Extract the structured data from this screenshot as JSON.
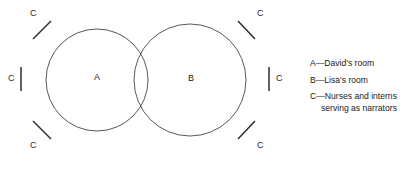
{
  "diagram": {
    "type": "venn-two-set",
    "title": "",
    "background_color": "#ffffff",
    "stroke_color": "#2b2b2b",
    "sets": [
      {
        "id": "A",
        "label": "A",
        "meaning": "David's room",
        "center_x": 97,
        "center_y": 80,
        "radius": 51,
        "label_x": 96,
        "label_y": 77
      },
      {
        "id": "B",
        "label": "B",
        "meaning": "Lisa's room",
        "center_x": 190,
        "center_y": 80,
        "radius": 56,
        "label_x": 190,
        "label_y": 78
      }
    ],
    "narrators": {
      "label": "C",
      "meaning": "Nurses and interns serving as narrators",
      "count": 6,
      "marks": [
        {
          "position": "top-left",
          "label": "C",
          "label_x": 32,
          "label_y": 13,
          "tick": "slash"
        },
        {
          "position": "top-right",
          "label": "C",
          "label_x": 256,
          "label_y": 13,
          "tick": "backslash"
        },
        {
          "position": "left-middle",
          "label": "C",
          "label_x": 10,
          "label_y": 78,
          "tick": "vertical"
        },
        {
          "position": "right-middle",
          "label": "C",
          "label_x": 278,
          "label_y": 78,
          "tick": "vertical"
        },
        {
          "position": "bottom-left",
          "label": "C",
          "label_x": 32,
          "label_y": 145,
          "tick": "backslash"
        },
        {
          "position": "bottom-right",
          "label": "C",
          "label_x": 256,
          "label_y": 145,
          "tick": "slash"
        }
      ]
    }
  },
  "legend": {
    "items": [
      {
        "key": "A",
        "separator": "—",
        "text": "A—David's room",
        "continuation": ""
      },
      {
        "key": "B",
        "separator": "—",
        "text": "B—Lisa's room",
        "continuation": ""
      },
      {
        "key": "C",
        "separator": "—",
        "text": "C—Nurses and interns",
        "continuation": "serving as narrators"
      }
    ]
  }
}
